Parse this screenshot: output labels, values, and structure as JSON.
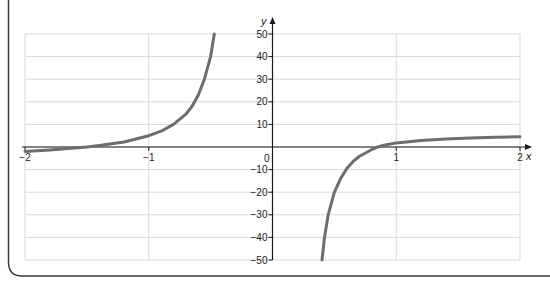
{
  "chart_data": {
    "type": "line",
    "title": "",
    "xlabel": "x",
    "ylabel": "y",
    "xlim": [
      -2,
      2
    ],
    "ylim": [
      -50,
      50
    ],
    "grid": true,
    "x_ticks": [
      -2,
      -1,
      0,
      1,
      2
    ],
    "x_tick_labels": [
      "−2",
      "−1",
      "0",
      "1",
      "2"
    ],
    "y_ticks": [
      50,
      40,
      30,
      20,
      10,
      -10,
      -20,
      -30,
      -40,
      -50
    ],
    "y_tick_labels": [
      "50",
      "40",
      "30",
      "20",
      "10",
      "−10",
      "−20",
      "−30",
      "−40",
      "−50"
    ],
    "origin_label": "0",
    "vertical_asymptote": 0,
    "series": [
      {
        "name": "left-branch",
        "x": [
          -2.0,
          -1.8,
          -1.6,
          -1.5,
          -1.4,
          -1.2,
          -1.0,
          -0.9,
          -0.8,
          -0.7,
          -0.65,
          -0.6,
          -0.55,
          -0.5,
          -0.47
        ],
        "y": [
          -2.0,
          -1.3,
          -0.5,
          0.0,
          0.6,
          2.2,
          5.0,
          7.0,
          10.0,
          14.5,
          18.0,
          23.0,
          30.0,
          40.0,
          50.0
        ]
      },
      {
        "name": "right-branch",
        "x": [
          0.4,
          0.42,
          0.45,
          0.5,
          0.55,
          0.6,
          0.65,
          0.7,
          0.8,
          0.85,
          0.9,
          1.0,
          1.2,
          1.4,
          1.6,
          1.8,
          2.0
        ],
        "y": [
          -50.0,
          -40.0,
          -30.0,
          -20.0,
          -14.0,
          -9.5,
          -6.5,
          -4.2,
          -1.2,
          0.0,
          0.8,
          1.8,
          2.9,
          3.5,
          4.0,
          4.3,
          4.5
        ]
      }
    ],
    "colors": {
      "curve": "#6d6d6d",
      "axis": "#1a1a1a",
      "grid": "#d9d9d9",
      "frame": "#3a3a3a"
    }
  }
}
